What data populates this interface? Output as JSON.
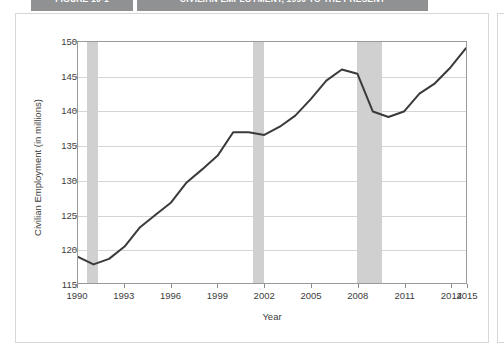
{
  "tabs": [
    {
      "label": "FIGURE 10-1"
    },
    {
      "label": "CIVILIAN EMPLOYMENT, 1990 TO THE PRESENT"
    }
  ],
  "chart_data": {
    "type": "line",
    "title": "",
    "xlabel": "Year",
    "ylabel": "Civilian Employment (in millions)",
    "xlim": [
      1990,
      2015
    ],
    "ylim": [
      115,
      150
    ],
    "grid": true,
    "legend": "none",
    "ytick_labels": [
      "115",
      "120",
      "125",
      "130",
      "135",
      "140",
      "145",
      "150"
    ],
    "ytick_values": [
      115,
      120,
      125,
      130,
      135,
      140,
      145,
      150
    ],
    "xtick_labels": [
      "1990",
      "1993",
      "1996",
      "1999",
      "2002",
      "2005",
      "2008",
      "2011",
      "2014",
      "2015"
    ],
    "xtick_values": [
      1990,
      1993,
      1996,
      1999,
      2002,
      2005,
      2008,
      2011,
      2014,
      2015
    ],
    "line_color": "#3a3a3a",
    "band_color": "#d0d0d0",
    "shaded_regions": [
      {
        "name": "recession-1990-1991",
        "start": 1990.6,
        "end": 1991.3
      },
      {
        "name": "recession-2001",
        "start": 2001.2,
        "end": 2001.9
      },
      {
        "name": "recession-2007-2009",
        "start": 2007.9,
        "end": 2009.5
      }
    ],
    "x": [
      1990,
      1991,
      1992,
      1993,
      1994,
      1995,
      1996,
      1997,
      1998,
      1999,
      2000,
      2001,
      2002,
      2003,
      2004,
      2005,
      2006,
      2007,
      2008,
      2009,
      2010,
      2011,
      2012,
      2013,
      2014,
      2015
    ],
    "values": [
      118.8,
      117.7,
      118.5,
      120.3,
      123.1,
      124.9,
      126.7,
      129.6,
      131.5,
      133.5,
      136.9,
      136.9,
      136.5,
      137.7,
      139.3,
      141.7,
      144.4,
      146.0,
      145.4,
      139.9,
      139.1,
      139.9,
      142.5,
      144.0,
      146.3,
      149.1
    ],
    "annotations": [
      {
        "text": "Shaded vertical bands mark recession periods."
      }
    ]
  }
}
